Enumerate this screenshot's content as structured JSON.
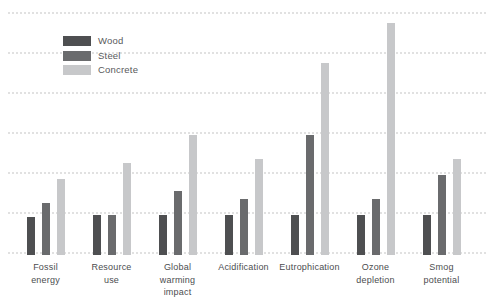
{
  "chart_data": {
    "type": "bar",
    "title": "",
    "xlabel": "",
    "ylabel": "",
    "ylim": [
      0,
      6
    ],
    "gridline_interval": 1,
    "grid": "horizontal-dotted",
    "legend_position": "top-left",
    "categories": [
      "Fossil\nenergy",
      "Resource\nuse",
      "Global\nwarming\nimpact",
      "Acidification",
      "Eutrophication",
      "Ozone\ndepletion",
      "Smog\npotential"
    ],
    "series": [
      {
        "name": "Wood",
        "color": "#4e4f51",
        "values": [
          0.95,
          1.0,
          1.0,
          1.0,
          1.0,
          1.0,
          1.0
        ]
      },
      {
        "name": "Steel",
        "color": "#6a6b6d",
        "values": [
          1.3,
          1.0,
          1.6,
          1.4,
          3.0,
          1.4,
          2.0
        ]
      },
      {
        "name": "Concrete",
        "color": "#c7c8ca",
        "values": [
          1.9,
          2.3,
          3.0,
          2.4,
          4.8,
          5.8,
          2.4
        ]
      }
    ],
    "colors": {
      "gridline": "#e1e1e1",
      "category_text": "#4c4d4f",
      "legend_text": "#58595b"
    }
  }
}
